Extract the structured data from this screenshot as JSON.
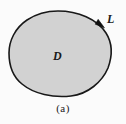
{
  "figure": {
    "caption": "(a)",
    "type": "closed-region-with-oriented-boundary-curve",
    "background_color": "#fbfbfb",
    "labels": {
      "region": "D",
      "curve": "L"
    },
    "region": {
      "name": "D",
      "fill_color": "#d2d2d2",
      "description": "shaded closed planar region"
    },
    "boundary": {
      "name": "L",
      "stroke_color": "#181818",
      "stroke_width": 1.6,
      "orientation": "counterclockwise",
      "arrow_marker": "filled-triangle",
      "arrow_position_deg": 48
    },
    "geometry": {
      "extent_left_px": 9,
      "extent_right_px": 112,
      "extent_top_px": 11,
      "extent_bottom_px": 97,
      "path": "M 58 11 C 78 11 97 19 106 33 C 113 44 112 57 108 68 C 102 82 88 94 71 96 C 53 98 34 94 22 84 C 12 76 9 64 9 53 C 9 41 15 28 27 20 C 36 14 47 11 58 11 Z"
    }
  }
}
